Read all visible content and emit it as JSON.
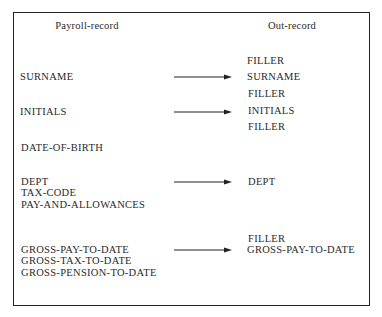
{
  "headers": {
    "left": "Payroll-record",
    "right": "Out-record"
  },
  "payroll_record": {
    "fields": [
      "SURNAME",
      "INITIALS",
      "DATE-OF-BIRTH",
      "DEPT",
      "TAX-CODE",
      "PAY-AND-ALLOWANCES",
      "GROSS-PAY-TO-DATE",
      "GROSS-TAX-TO-DATE",
      "GROSS-PENSION-TO-DATE"
    ]
  },
  "out_record": {
    "fields": [
      "FILLER",
      "SURNAME",
      "FILLER",
      "INITIALS",
      "FILLER",
      "DEPT",
      "FILLER",
      "GROSS-PAY-TO-DATE"
    ]
  },
  "mappings": [
    {
      "from": "SURNAME",
      "to": "SURNAME"
    },
    {
      "from": "INITIALS",
      "to": "INITIALS"
    },
    {
      "from": "DEPT",
      "to": "DEPT"
    },
    {
      "from": "GROSS-PAY-TO-DATE",
      "to": "GROSS-PAY-TO-DATE"
    }
  ]
}
